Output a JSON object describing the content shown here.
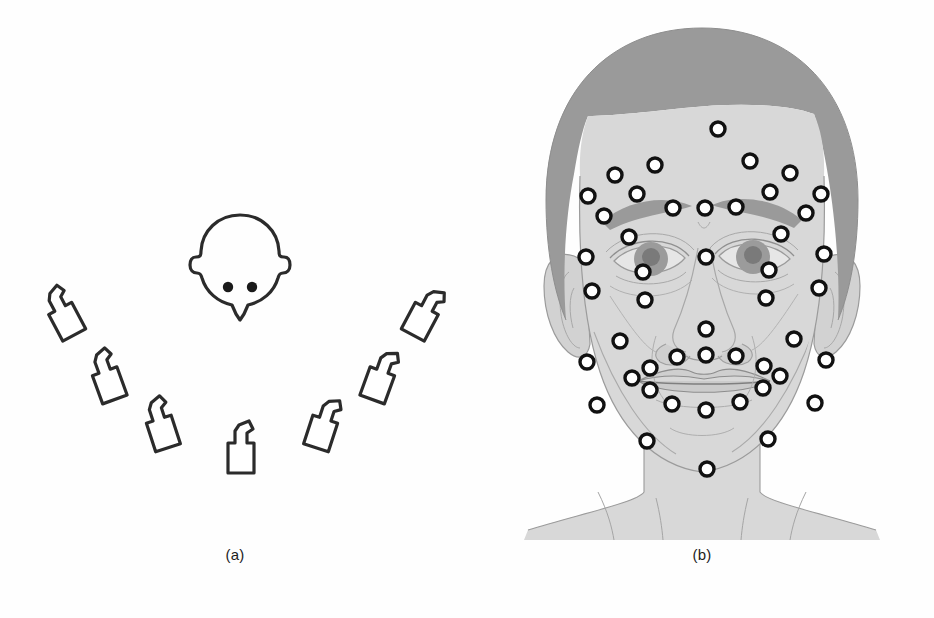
{
  "figure": {
    "background_color": "#fefefe",
    "width": 934,
    "height": 618,
    "panels": [
      {
        "id": "a",
        "caption": "(a)",
        "description": "Camera rig layout: seven camcorders arranged in an arc around a head seen from above"
      },
      {
        "id": "b",
        "caption": "(b)",
        "description": "Frontal face with fiducial markers attached"
      }
    ]
  },
  "panel_a": {
    "caption": "(a)",
    "ink_color": "#2b2b2b",
    "stroke_width": 3.2,
    "subject": {
      "label": "head-top-view",
      "center": {
        "x": 240,
        "y": 258
      },
      "eye_dots": 2,
      "eye_color": "#1a1a1a"
    },
    "camera_count": 7,
    "cameras": [
      {
        "id": "cam-1",
        "name": "camera-far-left",
        "x": 62,
        "y": 312,
        "rotation": -28
      },
      {
        "id": "cam-2",
        "name": "camera-mid-left",
        "x": 106,
        "y": 375,
        "rotation": -20
      },
      {
        "id": "cam-3",
        "name": "camera-inner-left",
        "x": 160,
        "y": 423,
        "rotation": -18
      },
      {
        "id": "cam-4",
        "name": "camera-center",
        "x": 241,
        "y": 447,
        "rotation": 0
      },
      {
        "id": "cam-5",
        "name": "camera-inner-right",
        "x": 324,
        "y": 423,
        "rotation": 18
      },
      {
        "id": "cam-6",
        "name": "camera-mid-right",
        "x": 381,
        "y": 375,
        "rotation": 20
      },
      {
        "id": "cam-7",
        "name": "camera-far-right",
        "x": 425,
        "y": 312,
        "rotation": 28
      }
    ]
  },
  "panel_b": {
    "caption": "(b)",
    "colors": {
      "hair": "#9a9a9a",
      "skin": "#d8d8d8",
      "skin_shadow": "#c9c9c9",
      "line": "#8a8a8a",
      "marker_ring": "#111111",
      "marker_fill": "#ffffff",
      "iris": "#9b9b9b",
      "pupil": "#7a7a7a",
      "brow": "#9a9a9a",
      "lip_line": "#8d8d8d"
    },
    "marker_count": 51,
    "marker_radius": 7,
    "marker_ring_width": 3.4,
    "marker_regions": [
      "forehead",
      "brow",
      "glabella",
      "periorbital",
      "temple",
      "nose",
      "cheek",
      "perioral",
      "chin",
      "jawline"
    ],
    "markers": [
      {
        "region": "forehead",
        "x": 248,
        "y": 129
      },
      {
        "region": "forehead",
        "x": 185,
        "y": 165
      },
      {
        "region": "forehead",
        "x": 280,
        "y": 161
      },
      {
        "region": "forehead",
        "x": 145,
        "y": 175
      },
      {
        "region": "forehead",
        "x": 320,
        "y": 173
      },
      {
        "region": "brow",
        "x": 118,
        "y": 196
      },
      {
        "region": "brow",
        "x": 351,
        "y": 194
      },
      {
        "region": "brow",
        "x": 167,
        "y": 194
      },
      {
        "region": "brow",
        "x": 300,
        "y": 192
      },
      {
        "region": "brow",
        "x": 203,
        "y": 208
      },
      {
        "region": "brow",
        "x": 266,
        "y": 207
      },
      {
        "region": "glabella",
        "x": 235,
        "y": 208
      },
      {
        "region": "brow",
        "x": 134,
        "y": 216
      },
      {
        "region": "brow",
        "x": 336,
        "y": 213
      },
      {
        "region": "periorbital",
        "x": 159,
        "y": 237
      },
      {
        "region": "periorbital",
        "x": 311,
        "y": 234
      },
      {
        "region": "temple",
        "x": 116,
        "y": 257
      },
      {
        "region": "temple",
        "x": 354,
        "y": 254
      },
      {
        "region": "periorbital",
        "x": 236,
        "y": 257
      },
      {
        "region": "periorbital",
        "x": 173,
        "y": 272
      },
      {
        "region": "periorbital",
        "x": 299,
        "y": 270
      },
      {
        "region": "cheek",
        "x": 122,
        "y": 291
      },
      {
        "region": "cheek",
        "x": 349,
        "y": 288
      },
      {
        "region": "cheek",
        "x": 175,
        "y": 300
      },
      {
        "region": "cheek",
        "x": 296,
        "y": 298
      },
      {
        "region": "nose",
        "x": 236,
        "y": 329
      },
      {
        "region": "cheek",
        "x": 150,
        "y": 341
      },
      {
        "region": "cheek",
        "x": 324,
        "y": 339
      },
      {
        "region": "nose",
        "x": 207,
        "y": 357
      },
      {
        "region": "nose",
        "x": 236,
        "y": 355
      },
      {
        "region": "nose",
        "x": 266,
        "y": 356
      },
      {
        "region": "cheek",
        "x": 117,
        "y": 362
      },
      {
        "region": "cheek",
        "x": 356,
        "y": 360
      },
      {
        "region": "perioral",
        "x": 180,
        "y": 368
      },
      {
        "region": "perioral",
        "x": 294,
        "y": 366
      },
      {
        "region": "perioral",
        "x": 162,
        "y": 378
      },
      {
        "region": "perioral",
        "x": 310,
        "y": 376
      },
      {
        "region": "perioral",
        "x": 180,
        "y": 390
      },
      {
        "region": "perioral",
        "x": 293,
        "y": 388
      },
      {
        "region": "perioral",
        "x": 202,
        "y": 404
      },
      {
        "region": "perioral",
        "x": 270,
        "y": 402
      },
      {
        "region": "chin",
        "x": 236,
        "y": 410
      },
      {
        "region": "cheek",
        "x": 127,
        "y": 405
      },
      {
        "region": "cheek",
        "x": 345,
        "y": 403
      },
      {
        "region": "jawline",
        "x": 177,
        "y": 441
      },
      {
        "region": "jawline",
        "x": 298,
        "y": 439
      },
      {
        "region": "chin",
        "x": 237,
        "y": 469
      }
    ]
  }
}
